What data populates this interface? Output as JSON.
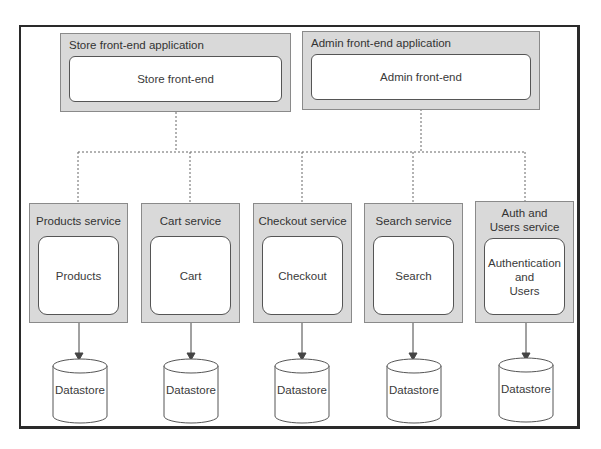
{
  "diagram": {
    "frontends": [
      {
        "title": "Store front-end application",
        "component": "Store front-end"
      },
      {
        "title": "Admin front-end application",
        "component": "Admin front-end"
      }
    ],
    "services": [
      {
        "title": "Products service",
        "component": "Products",
        "datastore": "Datastore"
      },
      {
        "title": "Cart service",
        "component": "Cart",
        "datastore": "Datastore"
      },
      {
        "title": "Checkout service",
        "component": "Checkout",
        "datastore": "Datastore"
      },
      {
        "title": "Search service",
        "component": "Search",
        "datastore": "Datastore"
      },
      {
        "title": "Auth and Users service",
        "component": "Authentication\nand\nUsers",
        "datastore": "Datastore"
      }
    ],
    "colors": {
      "container_fill": "#d9d9d9",
      "container_border": "#8a8a8a",
      "inner_fill": "#ffffff",
      "line": "#555555",
      "frame": "#2a2a2a"
    }
  }
}
